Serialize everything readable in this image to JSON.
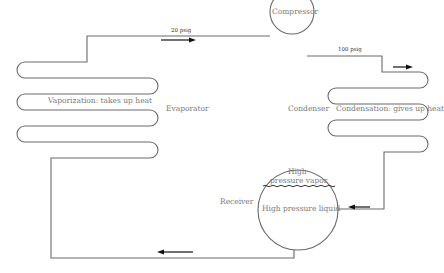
{
  "diagram": {
    "type": "refrigeration-cycle",
    "components": {
      "compressor": {
        "label": "Compressor"
      },
      "condenser": {
        "label": "Condenser",
        "process": "Condensation: gives up heat"
      },
      "receiver": {
        "label": "Receiver",
        "top": "High",
        "top2": "pressure vapor",
        "bottom": "High pressure liquid"
      },
      "evaporator": {
        "label": "Evaporator",
        "process": "Vaporization: takes up heat"
      }
    },
    "pressures": {
      "suction": "20 psig",
      "discharge": "100 psig"
    },
    "flow_direction": [
      "evaporator",
      "compressor",
      "condenser",
      "receiver",
      "evaporator"
    ]
  }
}
